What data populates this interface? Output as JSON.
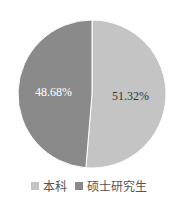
{
  "chart_data": {
    "type": "pie",
    "title": "",
    "categories": [
      "本科",
      "硕士研究生"
    ],
    "values": [
      51.32,
      48.68
    ],
    "labels": [
      "51.32%",
      "48.68%"
    ],
    "colors": [
      "#c4c4c4",
      "#8a8a8a"
    ],
    "label_colors": [
      "#333333",
      "#ffffff"
    ],
    "start_angle_deg": 0,
    "direction": "clockwise",
    "legend_position": "bottom",
    "legend": [
      "本科",
      "硕士研究生"
    ]
  }
}
